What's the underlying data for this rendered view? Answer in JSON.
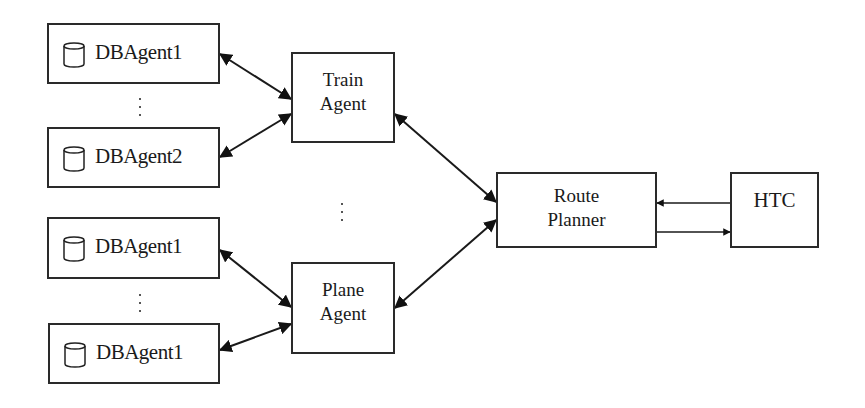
{
  "diagram": {
    "db_agents": [
      {
        "label": "DBAgent1",
        "icon": "database-icon"
      },
      {
        "label": "DBAgent2",
        "icon": "database-icon"
      },
      {
        "label": "DBAgent1",
        "icon": "database-icon"
      },
      {
        "label": "DBAgent1",
        "icon": "database-icon"
      }
    ],
    "train_agent": {
      "line1": "Train",
      "line2": "Agent"
    },
    "plane_agent": {
      "line1": "Plane",
      "line2": "Agent"
    },
    "route_planner": {
      "line1": "Route",
      "line2": "Planner"
    },
    "htc": {
      "label": "HTC"
    },
    "ellipsis": "⋮",
    "connections": [
      {
        "from": "DBAgent1 (top)",
        "to": "Train Agent",
        "type": "bidirectional"
      },
      {
        "from": "DBAgent2",
        "to": "Train Agent",
        "type": "bidirectional"
      },
      {
        "from": "DBAgent1 (third)",
        "to": "Plane Agent",
        "type": "bidirectional"
      },
      {
        "from": "DBAgent1 (bottom)",
        "to": "Plane Agent",
        "type": "bidirectional"
      },
      {
        "from": "Train Agent",
        "to": "Route Planner",
        "type": "bidirectional"
      },
      {
        "from": "Plane Agent",
        "to": "Route Planner",
        "type": "bidirectional"
      },
      {
        "from": "HTC",
        "to": "Route Planner",
        "type": "directed"
      },
      {
        "from": "Route Planner",
        "to": "HTC",
        "type": "directed"
      }
    ]
  }
}
